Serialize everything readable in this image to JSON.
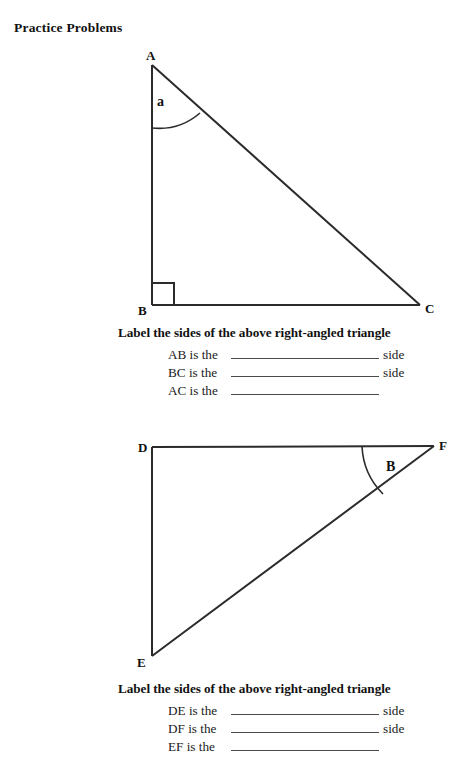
{
  "page": {
    "title": "Practice Problems"
  },
  "figure1": {
    "name": "right-angled-triangle-ABC",
    "vertices": [
      {
        "label": "A",
        "x": 152,
        "y": 65
      },
      {
        "label": "B",
        "x": 152,
        "y": 305
      },
      {
        "label": "C",
        "x": 420,
        "y": 305
      }
    ],
    "angle_label": "a",
    "right_angle_at": "B"
  },
  "figure2": {
    "name": "right-angled-triangle-DEF",
    "vertices": [
      {
        "label": "D",
        "x": 152,
        "y": 447
      },
      {
        "label": "E",
        "x": 152,
        "y": 656
      },
      {
        "label": "F",
        "x": 434,
        "y": 446
      }
    ],
    "angle_label": "B",
    "right_angle_at": "D"
  },
  "section1": {
    "prompt": "Label the sides of the above right-angled triangle",
    "rows": [
      {
        "lead": "AB is the",
        "answer": "",
        "tail": "side"
      },
      {
        "lead": "BC is the",
        "answer": "",
        "tail": "side"
      },
      {
        "lead": "AC is the",
        "answer": "",
        "tail": ""
      }
    ]
  },
  "section2": {
    "prompt": "Label the sides of the above right-angled triangle",
    "rows": [
      {
        "lead": "DE is the",
        "answer": "",
        "tail": "side"
      },
      {
        "lead": "DF is the",
        "answer": "",
        "tail": "side"
      },
      {
        "lead": "EF is the",
        "answer": "",
        "tail": ""
      }
    ]
  },
  "colors": {
    "ink": "#1a1a1a",
    "line": "#2b2b2b",
    "blank_rule": "#4a4a4a",
    "background": "#ffffff"
  }
}
